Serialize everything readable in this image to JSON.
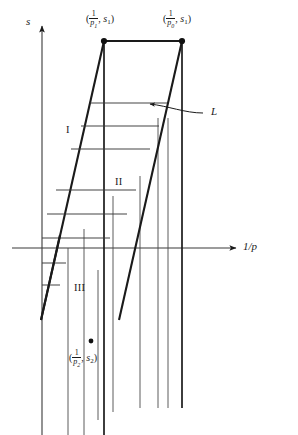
{
  "figure": {
    "background_color": "#ffffff",
    "line_color": "#1a1a1a",
    "thin_line_color": "#3a3a3a"
  },
  "axes": {
    "vertical_axis_label": "s",
    "horizontal_axis_label": "1/p",
    "horizontal_axis_label_numerator": "1",
    "horizontal_axis_label_denominator": "p",
    "origin_x": 42,
    "origin_y": 248,
    "y_axis_top": 22,
    "x_axis_right": 243
  },
  "points": [
    {
      "name": "upper-left-vertex",
      "label_prefix": "(",
      "numerator": "1",
      "denominator": "p",
      "denominator_subscript": "1",
      "comma": ", ",
      "second_coord": "s",
      "second_coord_subscript": "1",
      "label_suffix": ")",
      "label_text": "(1/p1, s1)",
      "x": 104,
      "y": 41,
      "label_x": 86,
      "label_y": 10
    },
    {
      "name": "upper-right-vertex",
      "label_prefix": "(",
      "numerator": "1",
      "denominator": "p",
      "denominator_subscript": "0",
      "comma": ", ",
      "second_coord": "s",
      "second_coord_subscript": "1",
      "label_suffix": ")",
      "label_text": "(1/p0, s1)",
      "x": 182,
      "y": 41,
      "label_x": 163,
      "label_y": 10
    },
    {
      "name": "lower-point",
      "label_prefix": "(",
      "numerator": "1",
      "denominator": "p",
      "denominator_subscript": "2",
      "comma": ", ",
      "second_coord": "s",
      "second_coord_subscript": "2",
      "label_suffix": ")",
      "label_text": "(1/p2, s2)",
      "x": 91,
      "y": 341,
      "label_x": 69,
      "label_y": 349,
      "dot_radius": 2.4
    }
  ],
  "regions": [
    {
      "name": "region-I",
      "label": "I",
      "x": 66,
      "y": 125
    },
    {
      "name": "region-II",
      "label": "II",
      "x": 115,
      "y": 177
    },
    {
      "name": "region-III",
      "label": "III",
      "x": 74,
      "y": 283
    }
  ],
  "annotations": [
    {
      "name": "line-L",
      "label": "L",
      "label_x": 211,
      "label_y": 112,
      "arrow_tip_x": 145,
      "arrow_tip_y": 104
    }
  ]
}
